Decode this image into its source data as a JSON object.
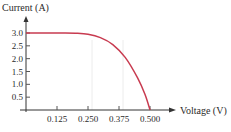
{
  "chart_data": {
    "type": "line",
    "title": "",
    "xlabel": "Voltage (V)",
    "ylabel": "Current (A)",
    "xlim": [
      0,
      0.5
    ],
    "ylim": [
      0,
      3.0
    ],
    "x_ticks": [
      0.125,
      0.25,
      0.375,
      0.5
    ],
    "x_tick_labels": [
      "0.125",
      "0.250",
      "0.375",
      "0.500"
    ],
    "y_ticks": [
      0.5,
      1.0,
      1.5,
      2.0,
      2.5,
      3.0
    ],
    "y_tick_labels": [
      "0.5",
      "1.0",
      "1.5",
      "2.0",
      "2.5",
      "3.0"
    ],
    "grid": "faint vertical lines at 0.25 and 0.375",
    "series": [
      {
        "name": "I-V curve",
        "color": "#c83b50",
        "x": [
          0,
          0.05,
          0.1,
          0.15,
          0.2,
          0.25,
          0.3,
          0.35,
          0.4,
          0.45,
          0.48,
          0.5
        ],
        "y": [
          3.0,
          3.0,
          3.0,
          3.0,
          2.99,
          2.95,
          2.82,
          2.55,
          2.05,
          1.25,
          0.6,
          0.0
        ]
      }
    ]
  }
}
